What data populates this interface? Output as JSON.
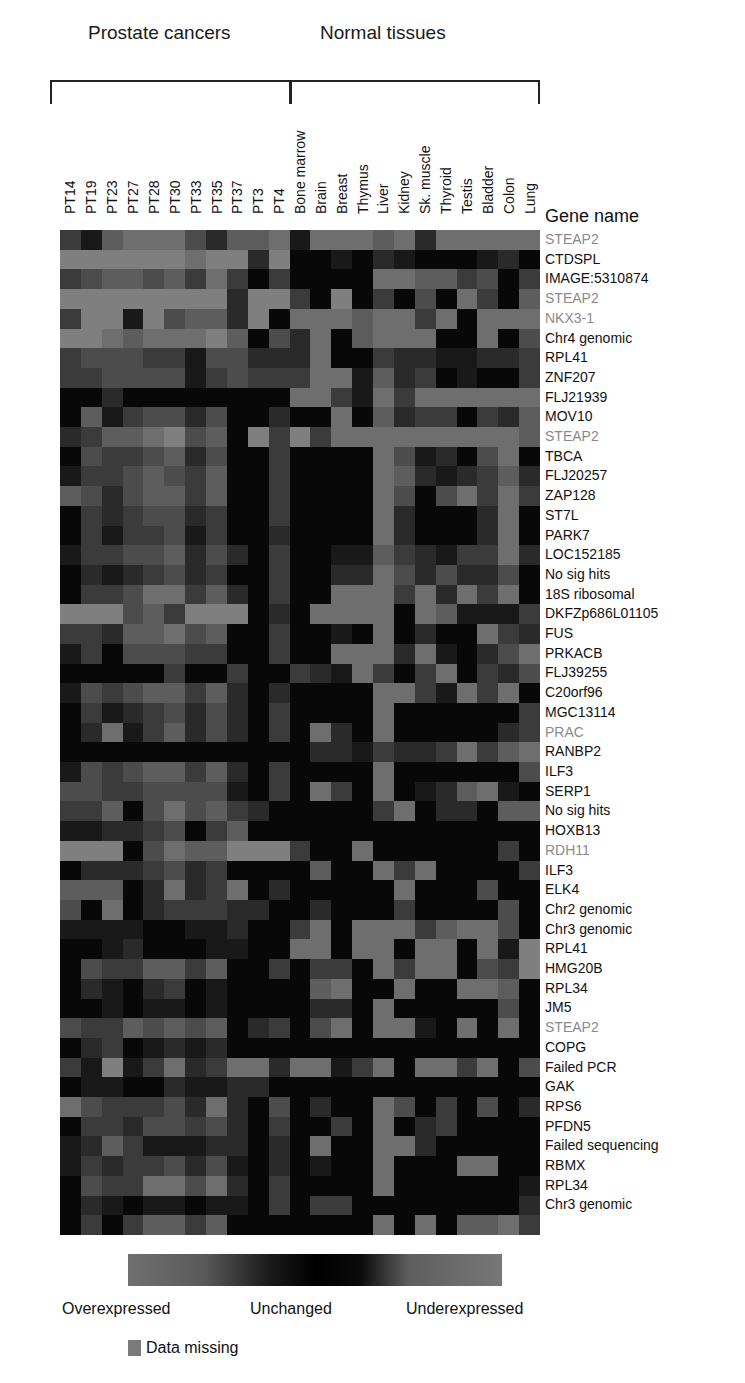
{
  "header": {
    "group_prostate": "Prostate cancers",
    "group_normal": "Normal tissues",
    "gene_header": "Gene name"
  },
  "legend": {
    "over": "Overexpressed",
    "unchanged": "Unchanged",
    "under": "Underexpressed",
    "missing": "Data missing"
  },
  "chart_data": {
    "type": "heatmap",
    "title": "",
    "column_groups": [
      {
        "name": "Prostate cancers",
        "columns": [
          "PT14",
          "PT19",
          "PT23",
          "PT27",
          "PT28",
          "PT30",
          "PT33",
          "PT35",
          "PT37",
          "PT3",
          "PT4"
        ]
      },
      {
        "name": "Normal tissues",
        "columns": [
          "Bone marrow",
          "Brain",
          "Breast",
          "Thymus",
          "Liver",
          "Kidney",
          "Sk. muscle",
          "Thyroid",
          "Testis",
          "Bladder",
          "Colon",
          "Lung"
        ]
      }
    ],
    "columns": [
      "PT14",
      "PT19",
      "PT23",
      "PT27",
      "PT28",
      "PT30",
      "PT33",
      "PT35",
      "PT37",
      "PT3",
      "PT4",
      "Bone marrow",
      "Brain",
      "Breast",
      "Thymus",
      "Liver",
      "Kidney",
      "Sk. muscle",
      "Thyroid",
      "Testis",
      "Bladder",
      "Colon",
      "Lung"
    ],
    "rows": [
      "STEAP2",
      "CTDSPL",
      "IMAGE:5310874",
      "STEAP2",
      "NKX3-1",
      "Chr4 genomic",
      "RPL41",
      "ZNF207",
      "FLJ21939",
      "MOV10",
      "STEAP2",
      "TBCA",
      "FLJ20257",
      "ZAP128",
      "ST7L",
      "PARK7",
      "LOC152185",
      "No sig hits",
      "18S ribosomal",
      "DKFZp686L01105",
      "FUS",
      "PRKACB",
      "FLJ39255",
      "C20orf96",
      "MGC13114",
      "PRAC",
      "RANBP2",
      "ILF3",
      "SERP1",
      "No sig hits",
      "HOXB13",
      "RDH11",
      "ILF3",
      "ELK4",
      "Chr2 genomic",
      "Chr3 genomic",
      "RPL41",
      "HMG20B",
      "RPL34",
      "JM5",
      "STEAP2",
      "COPG",
      "Failed PCR",
      "GAK",
      "RPS6",
      "PFDN5",
      "Failed sequencing",
      "RBMX",
      "RPL34",
      "Chr3 genomic"
    ],
    "highlighted_rows": [
      "STEAP2",
      "NKX3-1",
      "PRAC",
      "RDH11"
    ],
    "scale": {
      "min_label": "Overexpressed",
      "mid_label": "Unchanged",
      "max_label": "Underexpressed",
      "note": "intensity 0 = unchanged (black), higher = stronger deviation (gray)"
    },
    "values": [
      [
        3,
        1,
        5,
        6,
        6,
        6,
        4,
        2,
        5,
        5,
        6,
        1,
        6,
        6,
        6,
        5,
        6,
        2,
        6,
        6,
        6,
        6,
        6
      ],
      [
        7,
        7,
        7,
        7,
        7,
        7,
        6,
        7,
        7,
        2,
        7,
        0,
        0,
        1,
        0,
        2,
        1,
        0,
        0,
        0,
        1,
        2,
        0
      ],
      [
        3,
        4,
        5,
        5,
        4,
        5,
        3,
        6,
        3,
        0,
        3,
        0,
        0,
        0,
        0,
        6,
        6,
        5,
        5,
        3,
        4,
        0,
        3
      ],
      [
        7,
        7,
        7,
        7,
        7,
        7,
        7,
        7,
        2,
        7,
        7,
        3,
        0,
        7,
        0,
        3,
        0,
        4,
        0,
        6,
        3,
        0,
        5
      ],
      [
        3,
        7,
        7,
        1,
        7,
        4,
        5,
        5,
        2,
        7,
        0,
        6,
        6,
        6,
        5,
        6,
        6,
        3,
        6,
        0,
        6,
        6,
        6
      ],
      [
        7,
        7,
        6,
        5,
        6,
        6,
        6,
        7,
        5,
        0,
        4,
        2,
        6,
        0,
        5,
        6,
        6,
        6,
        0,
        0,
        6,
        0,
        4
      ],
      [
        3,
        4,
        4,
        4,
        3,
        3,
        1,
        4,
        4,
        2,
        2,
        2,
        6,
        0,
        0,
        3,
        2,
        2,
        1,
        1,
        2,
        2,
        3
      ],
      [
        3,
        3,
        4,
        4,
        4,
        4,
        1,
        3,
        4,
        3,
        3,
        3,
        6,
        6,
        1,
        5,
        2,
        3,
        0,
        1,
        0,
        0,
        3
      ],
      [
        0,
        0,
        2,
        0,
        0,
        0,
        0,
        0,
        0,
        0,
        0,
        6,
        6,
        3,
        1,
        6,
        3,
        6,
        6,
        6,
        6,
        6,
        6
      ],
      [
        0,
        5,
        1,
        3,
        4,
        4,
        2,
        4,
        0,
        0,
        2,
        0,
        0,
        6,
        0,
        5,
        2,
        3,
        3,
        0,
        3,
        2,
        5
      ],
      [
        2,
        3,
        5,
        5,
        6,
        7,
        4,
        5,
        0,
        7,
        3,
        7,
        3,
        6,
        6,
        6,
        6,
        6,
        6,
        6,
        6,
        6,
        5
      ],
      [
        0,
        4,
        3,
        3,
        4,
        5,
        2,
        4,
        0,
        0,
        3,
        0,
        0,
        0,
        0,
        6,
        4,
        1,
        2,
        0,
        4,
        6,
        0
      ],
      [
        1,
        3,
        3,
        4,
        5,
        4,
        3,
        5,
        0,
        0,
        3,
        0,
        0,
        0,
        0,
        6,
        5,
        2,
        1,
        2,
        3,
        5,
        2
      ],
      [
        5,
        4,
        2,
        4,
        5,
        5,
        3,
        5,
        0,
        0,
        3,
        0,
        0,
        0,
        0,
        6,
        4,
        0,
        4,
        6,
        3,
        6,
        3
      ],
      [
        0,
        3,
        2,
        3,
        4,
        4,
        2,
        3,
        0,
        0,
        3,
        0,
        0,
        0,
        0,
        6,
        2,
        0,
        0,
        0,
        2,
        6,
        0
      ],
      [
        0,
        3,
        1,
        3,
        3,
        4,
        1,
        3,
        0,
        0,
        2,
        0,
        0,
        0,
        0,
        6,
        2,
        0,
        0,
        0,
        2,
        6,
        0
      ],
      [
        1,
        3,
        3,
        4,
        4,
        5,
        2,
        4,
        2,
        0,
        3,
        0,
        0,
        1,
        1,
        5,
        3,
        2,
        1,
        3,
        3,
        6,
        2
      ],
      [
        0,
        2,
        1,
        2,
        3,
        4,
        2,
        3,
        0,
        0,
        3,
        0,
        0,
        2,
        2,
        6,
        4,
        2,
        4,
        2,
        2,
        4,
        0
      ],
      [
        0,
        3,
        3,
        4,
        6,
        6,
        3,
        5,
        2,
        0,
        3,
        0,
        0,
        6,
        6,
        6,
        3,
        6,
        2,
        6,
        3,
        6,
        0
      ],
      [
        7,
        7,
        7,
        4,
        5,
        3,
        7,
        7,
        7,
        0,
        2,
        0,
        6,
        6,
        6,
        6,
        0,
        6,
        5,
        1,
        1,
        1,
        3
      ],
      [
        3,
        3,
        2,
        5,
        5,
        6,
        4,
        5,
        0,
        0,
        3,
        0,
        0,
        1,
        0,
        6,
        0,
        2,
        0,
        0,
        6,
        3,
        2
      ],
      [
        1,
        3,
        0,
        4,
        4,
        4,
        3,
        3,
        0,
        0,
        3,
        0,
        0,
        6,
        6,
        6,
        2,
        6,
        1,
        0,
        2,
        4,
        6
      ],
      [
        0,
        0,
        0,
        0,
        0,
        3,
        0,
        0,
        3,
        0,
        0,
        3,
        2,
        1,
        6,
        3,
        0,
        3,
        6,
        0,
        3,
        2,
        4
      ],
      [
        1,
        4,
        3,
        4,
        5,
        5,
        3,
        5,
        2,
        0,
        2,
        0,
        0,
        0,
        0,
        6,
        6,
        3,
        1,
        6,
        3,
        6,
        0
      ],
      [
        0,
        3,
        1,
        2,
        3,
        4,
        2,
        4,
        2,
        0,
        3,
        0,
        0,
        0,
        0,
        6,
        0,
        0,
        0,
        0,
        0,
        0,
        3
      ],
      [
        0,
        2,
        6,
        1,
        3,
        5,
        2,
        4,
        2,
        0,
        3,
        0,
        6,
        2,
        0,
        6,
        0,
        0,
        0,
        0,
        0,
        2,
        3
      ],
      [
        0,
        0,
        0,
        0,
        0,
        0,
        0,
        0,
        0,
        0,
        0,
        0,
        2,
        2,
        1,
        3,
        2,
        2,
        3,
        6,
        3,
        5,
        6
      ],
      [
        1,
        4,
        3,
        4,
        5,
        5,
        3,
        5,
        2,
        0,
        3,
        0,
        0,
        0,
        0,
        6,
        0,
        0,
        0,
        0,
        0,
        0,
        4
      ],
      [
        4,
        4,
        3,
        3,
        4,
        4,
        4,
        4,
        1,
        0,
        3,
        0,
        6,
        3,
        0,
        6,
        0,
        1,
        2,
        5,
        6,
        1,
        0
      ],
      [
        3,
        3,
        5,
        0,
        4,
        6,
        4,
        5,
        3,
        2,
        0,
        0,
        0,
        0,
        0,
        3,
        6,
        0,
        2,
        2,
        0,
        5,
        5
      ],
      [
        1,
        1,
        2,
        2,
        3,
        4,
        0,
        3,
        5,
        0,
        0,
        0,
        0,
        0,
        0,
        0,
        0,
        0,
        0,
        0,
        0,
        0,
        0
      ],
      [
        7,
        7,
        7,
        0,
        4,
        6,
        5,
        5,
        7,
        7,
        7,
        3,
        0,
        0,
        6,
        0,
        0,
        0,
        0,
        0,
        0,
        3,
        0
      ],
      [
        0,
        2,
        2,
        2,
        3,
        4,
        2,
        3,
        0,
        0,
        0,
        0,
        5,
        0,
        0,
        6,
        3,
        6,
        0,
        0,
        0,
        0,
        3
      ],
      [
        5,
        5,
        5,
        0,
        2,
        6,
        2,
        3,
        6,
        0,
        2,
        0,
        0,
        0,
        0,
        0,
        6,
        0,
        0,
        0,
        4,
        0,
        0
      ],
      [
        4,
        0,
        6,
        0,
        2,
        3,
        3,
        3,
        2,
        2,
        0,
        0,
        2,
        0,
        0,
        0,
        3,
        0,
        0,
        0,
        0,
        4,
        0
      ],
      [
        1,
        1,
        1,
        1,
        0,
        0,
        1,
        1,
        2,
        0,
        0,
        3,
        6,
        0,
        6,
        6,
        6,
        3,
        5,
        6,
        6,
        4,
        0
      ],
      [
        0,
        0,
        1,
        2,
        0,
        0,
        0,
        1,
        1,
        0,
        0,
        6,
        6,
        0,
        6,
        6,
        0,
        6,
        6,
        0,
        6,
        1,
        7
      ],
      [
        0,
        4,
        3,
        3,
        5,
        5,
        3,
        5,
        0,
        0,
        3,
        0,
        3,
        3,
        0,
        6,
        3,
        6,
        6,
        0,
        4,
        3,
        7
      ],
      [
        0,
        2,
        1,
        0,
        2,
        3,
        0,
        1,
        0,
        0,
        0,
        0,
        5,
        6,
        0,
        0,
        6,
        0,
        0,
        6,
        6,
        5,
        0
      ],
      [
        0,
        0,
        1,
        0,
        1,
        1,
        0,
        1,
        0,
        0,
        0,
        0,
        2,
        2,
        0,
        6,
        0,
        0,
        0,
        0,
        0,
        4,
        0
      ],
      [
        4,
        3,
        3,
        5,
        4,
        5,
        4,
        5,
        0,
        2,
        3,
        0,
        4,
        6,
        0,
        6,
        6,
        1,
        0,
        6,
        0,
        6,
        0
      ],
      [
        0,
        2,
        3,
        0,
        1,
        2,
        1,
        2,
        0,
        0,
        0,
        0,
        0,
        0,
        0,
        0,
        0,
        0,
        0,
        0,
        0,
        0,
        0
      ],
      [
        3,
        1,
        7,
        1,
        3,
        6,
        2,
        3,
        6,
        6,
        2,
        6,
        6,
        1,
        3,
        6,
        0,
        6,
        6,
        3,
        6,
        0,
        4
      ],
      [
        0,
        1,
        1,
        0,
        0,
        2,
        1,
        1,
        2,
        2,
        0,
        0,
        0,
        0,
        0,
        0,
        0,
        0,
        0,
        0,
        0,
        0,
        0
      ],
      [
        6,
        4,
        3,
        3,
        3,
        4,
        2,
        6,
        2,
        0,
        4,
        0,
        2,
        0,
        0,
        6,
        4,
        0,
        3,
        0,
        4,
        0,
        2
      ],
      [
        0,
        3,
        3,
        2,
        4,
        4,
        3,
        4,
        2,
        0,
        3,
        0,
        0,
        3,
        0,
        6,
        0,
        2,
        3,
        0,
        0,
        0,
        0
      ],
      [
        1,
        2,
        5,
        3,
        1,
        1,
        1,
        2,
        2,
        0,
        2,
        0,
        6,
        0,
        0,
        6,
        6,
        2,
        0,
        0,
        0,
        0,
        0
      ],
      [
        1,
        3,
        2,
        3,
        3,
        4,
        2,
        4,
        1,
        0,
        2,
        0,
        1,
        0,
        0,
        6,
        0,
        0,
        0,
        6,
        6,
        0,
        0
      ],
      [
        0,
        4,
        3,
        3,
        6,
        6,
        4,
        6,
        2,
        0,
        3,
        0,
        0,
        0,
        0,
        6,
        0,
        0,
        0,
        0,
        0,
        0,
        1
      ],
      [
        0,
        2,
        1,
        0,
        1,
        1,
        0,
        1,
        1,
        0,
        3,
        0,
        3,
        3,
        0,
        0,
        0,
        0,
        0,
        0,
        0,
        0,
        2
      ],
      [
        0,
        3,
        0,
        3,
        5,
        5,
        3,
        5,
        0,
        0,
        0,
        0,
        0,
        0,
        0,
        6,
        0,
        6,
        0,
        5,
        5,
        6,
        3
      ]
    ]
  }
}
